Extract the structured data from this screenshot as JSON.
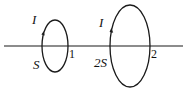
{
  "figure": {
    "background_color": "#ffffff",
    "stroke_color": "#1a1a1a",
    "width": 188,
    "height": 91,
    "axis": {
      "name": "common-axis-line",
      "x_start": 4,
      "x_end": 183,
      "y": 46,
      "stroke_width": 1.1
    },
    "loops": [
      {
        "id": "loop-1",
        "number_label": "1",
        "current_label": "I",
        "area_label": "S",
        "center_x": 55,
        "center_y": 46,
        "rx": 13,
        "ry": 26,
        "stroke_width": 1.3,
        "current_arrow": "upward-on-left-edge"
      },
      {
        "id": "loop-2",
        "number_label": "2",
        "current_label": "I",
        "area_label": "2S",
        "center_x": 130,
        "center_y": 46,
        "rx": 20,
        "ry": 41,
        "stroke_width": 1.3,
        "current_arrow": "upward-on-left-edge"
      }
    ]
  }
}
